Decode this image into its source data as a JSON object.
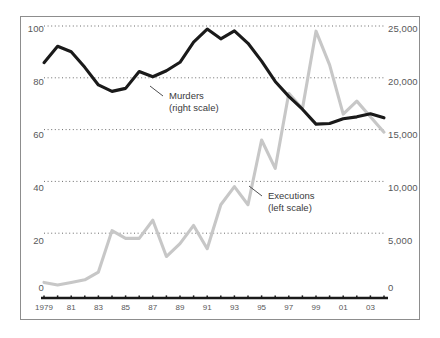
{
  "chart_data": {
    "type": "line",
    "title": "",
    "subtitle": "",
    "xlabel": "",
    "ylabel": "",
    "grid": "horizontal-dotted",
    "legend_position": "inline-annotations",
    "x": [
      1979,
      1980,
      1981,
      1982,
      1983,
      1984,
      1985,
      1986,
      1987,
      1988,
      1989,
      1990,
      1991,
      1992,
      1993,
      1994,
      1995,
      1996,
      1997,
      1998,
      1999,
      2000,
      2001,
      2002,
      2003,
      2004
    ],
    "x_tick_labels": [
      "1979",
      "81",
      "83",
      "85",
      "87",
      "89",
      "91",
      "93",
      "95",
      "97",
      "99",
      "01",
      "03"
    ],
    "x_tick_years": [
      1979,
      1981,
      1983,
      1985,
      1987,
      1989,
      1991,
      1993,
      1995,
      1997,
      1999,
      2001,
      2003
    ],
    "left_axis": {
      "name": "Executions",
      "ticks": [
        0,
        20,
        40,
        60,
        80,
        100
      ],
      "tick_labels": [
        "0",
        "20",
        "40",
        "60",
        "80",
        "100"
      ],
      "ylim": [
        0,
        100
      ]
    },
    "right_axis": {
      "name": "Murders",
      "ticks": [
        0,
        5000,
        10000,
        15000,
        20000,
        25000
      ],
      "tick_labels": [
        "0",
        "5,000",
        "10,000",
        "15,000",
        "20,000",
        "25,000"
      ],
      "ylim": [
        0,
        25000
      ]
    },
    "series": [
      {
        "name": "Executions",
        "annotation": "Executions",
        "annotation_scale": "(left scale)",
        "axis": "left",
        "color": "#c7c7c7",
        "values": [
          1,
          0,
          1,
          2,
          5,
          21,
          18,
          18,
          25,
          11,
          16,
          23,
          14,
          31,
          38,
          31,
          56,
          45,
          74,
          68,
          98,
          85,
          66,
          71,
          65,
          59
        ]
      },
      {
        "name": "Murders",
        "annotation": "Murders",
        "annotation_scale": "(right scale)",
        "axis": "right",
        "color": "#1a1a1a",
        "values": [
          21460,
          23040,
          22520,
          21010,
          19310,
          18690,
          18980,
          20610,
          20100,
          20680,
          21500,
          23440,
          24700,
          23760,
          24530,
          23330,
          21610,
          19650,
          18210,
          16970,
          15530,
          15590,
          16040,
          16230,
          16530,
          16140
        ]
      }
    ]
  },
  "axis_text": {
    "left_ticks": [
      "100",
      "80",
      "60",
      "40",
      "20",
      "0"
    ],
    "right_ticks": [
      "25,000",
      "20,000",
      "15,000",
      "10,000",
      "5,000",
      "0"
    ],
    "years": [
      "1979",
      "81",
      "83",
      "85",
      "87",
      "89",
      "91",
      "93",
      "95",
      "97",
      "99",
      "01",
      "03"
    ]
  },
  "annotations": {
    "murders_line1": "Murders",
    "murders_line2": "(right scale)",
    "executions_line1": "Executions",
    "executions_line2": "(left scale)"
  },
  "colors": {
    "murders_line": "#1a1a1a",
    "executions_line": "#c7c7c7",
    "frame": "#8d8d8d",
    "grid": "#6b6b6b",
    "text": "#58585a",
    "background": "#ffffff"
  }
}
